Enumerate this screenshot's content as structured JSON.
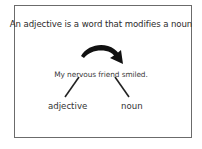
{
  "diagram": {
    "title": "An adjective is a word that modifies a noun",
    "sentence": "My nervous friend smiled.",
    "labels": {
      "adjective": "adjective",
      "noun": "noun"
    },
    "arrow": {
      "icon": "curved-arrow-icon",
      "from": "adjective",
      "to": "noun",
      "color": "#111111"
    },
    "connectors": [
      {
        "from": "nervous",
        "to": "adjective"
      },
      {
        "from": "friend",
        "to": "noun"
      }
    ],
    "frame_color": "#6b6b6b"
  }
}
